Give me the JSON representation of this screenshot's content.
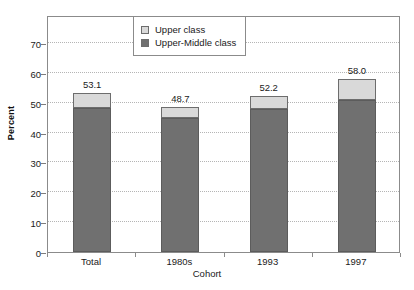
{
  "chart_data": {
    "type": "bar",
    "stacked": true,
    "title": "",
    "xlabel": "Cohort",
    "ylabel": "Percent",
    "categories": [
      "Total",
      "1980s",
      "1993",
      "1997"
    ],
    "series": [
      {
        "name": "Upper-Middle class",
        "color": "#707070",
        "values": [
          48.1,
          45.0,
          48.0,
          51.0
        ]
      },
      {
        "name": "Upper class",
        "color": "#d9d9d9",
        "values": [
          5.0,
          3.7,
          4.2,
          7.0
        ]
      }
    ],
    "totals": [
      53.1,
      48.7,
      52.2,
      58.0
    ],
    "data_labels": [
      "53.1",
      "48.7",
      "52.2",
      "58.0"
    ],
    "ylim": [
      0,
      70
    ],
    "yticks": [
      0,
      10,
      20,
      30,
      40,
      50,
      60,
      70
    ],
    "ytick_labels": [
      "0",
      "10",
      "20",
      "30",
      "40",
      "50",
      "60",
      "70"
    ],
    "grid": true,
    "legend_position": "top-center",
    "legend_entries": [
      "Upper class",
      "Upper-Middle class"
    ]
  },
  "legend": {
    "items": [
      {
        "label": "Upper class",
        "color": "#d9d9d9"
      },
      {
        "label": "Upper-Middle class",
        "color": "#707070"
      }
    ]
  },
  "axes": {
    "y_title": "Percent",
    "x_title": "Cohort"
  }
}
